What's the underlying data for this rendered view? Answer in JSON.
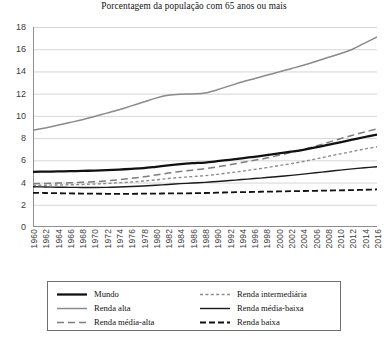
{
  "chart_data": {
    "type": "line",
    "title": "Porcentagem da população com 65 anos ou mais",
    "xlabel": "",
    "ylabel": "",
    "xlim": [
      1960,
      2016
    ],
    "ylim": [
      0,
      18
    ],
    "ytick_step": 2,
    "xtick_step": 2,
    "grid": true,
    "legend_position": "bottom",
    "y_ticks": [
      "0",
      "2",
      "4",
      "6",
      "8",
      "10",
      "12",
      "14",
      "16",
      "18"
    ],
    "x_ticks": [
      "1960",
      "1962",
      "1964",
      "1966",
      "1968",
      "1970",
      "1972",
      "1974",
      "1976",
      "1978",
      "1980",
      "1982",
      "1984",
      "1986",
      "1988",
      "1990",
      "1992",
      "1994",
      "1996",
      "1998",
      "2000",
      "2002",
      "2004",
      "2006",
      "2008",
      "2010",
      "2012",
      "2014",
      "2016"
    ],
    "x": [
      1960,
      1962,
      1964,
      1966,
      1968,
      1970,
      1972,
      1974,
      1976,
      1978,
      1980,
      1982,
      1984,
      1986,
      1988,
      1990,
      1992,
      1994,
      1996,
      1998,
      2000,
      2002,
      2004,
      2006,
      2008,
      2010,
      2012,
      2014,
      2016
    ],
    "series": [
      {
        "name": "Mundo",
        "style": "solid",
        "color": "#111111",
        "width": 2.3,
        "values": [
          4.97,
          4.98,
          5.0,
          5.02,
          5.05,
          5.08,
          5.12,
          5.17,
          5.23,
          5.3,
          5.42,
          5.55,
          5.66,
          5.74,
          5.8,
          5.92,
          6.05,
          6.18,
          6.32,
          6.46,
          6.62,
          6.78,
          6.95,
          7.16,
          7.4,
          7.62,
          7.86,
          8.1,
          8.32
        ]
      },
      {
        "name": "Renda alta",
        "style": "solid",
        "color": "#8a8a8a",
        "width": 1.5,
        "values": [
          8.7,
          8.92,
          9.15,
          9.4,
          9.65,
          9.95,
          10.25,
          10.55,
          10.9,
          11.25,
          11.6,
          11.85,
          11.95,
          11.98,
          12.05,
          12.35,
          12.7,
          13.05,
          13.35,
          13.65,
          13.95,
          14.25,
          14.55,
          14.9,
          15.25,
          15.6,
          16.0,
          16.55,
          17.1
        ]
      },
      {
        "name": "Renda média-alta",
        "style": "dashed-long",
        "color": "#7d7d7d",
        "width": 1.5,
        "values": [
          3.9,
          3.92,
          3.95,
          3.98,
          4.02,
          4.08,
          4.15,
          4.25,
          4.38,
          4.52,
          4.68,
          4.85,
          5.0,
          5.12,
          5.25,
          5.42,
          5.6,
          5.8,
          6.0,
          6.2,
          6.45,
          6.7,
          6.98,
          7.28,
          7.6,
          7.95,
          8.25,
          8.55,
          8.82
        ]
      },
      {
        "name": "Renda intermediária",
        "style": "dashed-short",
        "color": "#8c8c8c",
        "width": 1.4,
        "values": [
          3.75,
          3.76,
          3.78,
          3.8,
          3.83,
          3.87,
          3.92,
          3.98,
          4.05,
          4.14,
          4.24,
          4.36,
          4.46,
          4.54,
          4.62,
          4.74,
          4.88,
          5.02,
          5.18,
          5.34,
          5.52,
          5.7,
          5.9,
          6.12,
          6.35,
          6.58,
          6.8,
          7.02,
          7.22
        ]
      },
      {
        "name": "Renda média-baixa",
        "style": "solid",
        "color": "#1a1a1a",
        "width": 1.4,
        "values": [
          3.62,
          3.6,
          3.58,
          3.57,
          3.56,
          3.56,
          3.57,
          3.6,
          3.64,
          3.69,
          3.76,
          3.83,
          3.9,
          3.96,
          4.02,
          4.1,
          4.18,
          4.27,
          4.36,
          4.45,
          4.55,
          4.65,
          4.76,
          4.88,
          5.0,
          5.12,
          5.23,
          5.33,
          5.42
        ]
      },
      {
        "name": "Renda baixa",
        "style": "dash-dot",
        "color": "#111111",
        "width": 1.8,
        "values": [
          3.08,
          3.06,
          3.04,
          3.02,
          3.01,
          3.0,
          2.99,
          2.99,
          2.99,
          3.0,
          3.01,
          3.02,
          3.03,
          3.04,
          3.06,
          3.09,
          3.12,
          3.14,
          3.16,
          3.18,
          3.2,
          3.22,
          3.24,
          3.26,
          3.28,
          3.3,
          3.32,
          3.35,
          3.38
        ]
      }
    ]
  },
  "legend": {
    "columns": [
      {
        "items": [
          {
            "label": "Mundo",
            "series": "Mundo"
          },
          {
            "label": "Renda alta",
            "series": "Renda alta"
          },
          {
            "label": "Renda média-alta",
            "series": "Renda média-alta"
          }
        ]
      },
      {
        "items": [
          {
            "label": "Renda intermediária",
            "series": "Renda intermediária"
          },
          {
            "label": "Renda média-baixa",
            "series": "Renda média-baixa"
          },
          {
            "label": "Renda baixa",
            "series": "Renda baixa"
          }
        ]
      }
    ]
  },
  "colors": {
    "grid": "#d6d6d6",
    "axis": "#8f8f8f",
    "text": "#3b3b3b",
    "legend_border": "#6f6f6f"
  }
}
